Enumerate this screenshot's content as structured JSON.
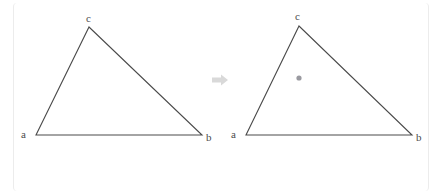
{
  "figure": {
    "type": "geometry-transformation-diagram",
    "colors": {
      "stroke": "#4a4a4a",
      "label": "#4c4c4c",
      "arrow": "#d9d9d9",
      "point_marker": "#9a9aa0",
      "panel_border": "#ececec",
      "background": "#ffffff"
    },
    "panels": [
      {
        "name": "left-triangle",
        "vertices": [
          {
            "label": "a",
            "x": 36,
            "y": 135,
            "label_x": 21,
            "label_y": 129
          },
          {
            "label": "b",
            "x": 202,
            "y": 135,
            "label_x": 206,
            "label_y": 132
          },
          {
            "label": "c",
            "x": 89,
            "y": 27,
            "label_x": 86,
            "label_y": 13
          }
        ],
        "interior_point": null
      },
      {
        "name": "right-triangle",
        "vertices": [
          {
            "label": "a",
            "x": 246,
            "y": 135,
            "label_x": 231,
            "label_y": 129
          },
          {
            "label": "b",
            "x": 412,
            "y": 135,
            "label_x": 416,
            "label_y": 132
          },
          {
            "label": "c",
            "x": 299,
            "y": 26,
            "label_x": 295,
            "label_y": 11
          }
        ],
        "interior_point": {
          "name": "centroid-point",
          "x": 299,
          "y": 78,
          "radius": 2.6
        }
      }
    ],
    "arrow": {
      "name": "transform-arrow",
      "direction": "right",
      "x1": 212,
      "y1": 80,
      "x2": 228,
      "y2": 80,
      "shaft_half_height": 2.6,
      "head_half_height": 5.5,
      "head_length": 7
    }
  }
}
